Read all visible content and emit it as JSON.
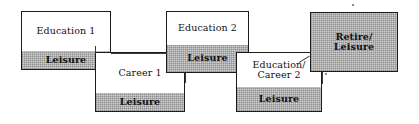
{
  "diagram": {
    "colors": {
      "box_border": "#1b1b1b",
      "segment_gray": "#cfcfcf",
      "segment_white": "#ffffff",
      "connector": "#3a3a3a",
      "text": "#111111",
      "background": "#ffffff"
    },
    "blocks": [
      {
        "id": "education-1",
        "segments": [
          {
            "id": "education-1-title",
            "label": "Education 1",
            "fill": "white",
            "bold": false
          },
          {
            "id": "education-1-leisure",
            "label": "Leisure",
            "fill": "gray",
            "bold": true
          }
        ]
      },
      {
        "id": "career-1",
        "segments": [
          {
            "id": "career-1-title",
            "label": "Career 1",
            "fill": "white",
            "bold": false
          },
          {
            "id": "career-1-leisure",
            "label": "Leisure",
            "fill": "gray",
            "bold": true
          }
        ]
      },
      {
        "id": "education-2",
        "segments": [
          {
            "id": "education-2-title",
            "label": "Education 2",
            "fill": "white",
            "bold": false
          },
          {
            "id": "education-2-leisure",
            "label": "Leisure",
            "fill": "gray",
            "bold": true
          }
        ]
      },
      {
        "id": "education-career-2",
        "segments": [
          {
            "id": "education-career-2-title",
            "label": "Education/\nCareer 2",
            "fill": "white",
            "bold": false
          },
          {
            "id": "education-career-2-leisure",
            "label": "Leisure",
            "fill": "gray",
            "bold": true
          }
        ]
      },
      {
        "id": "retire-leisure",
        "segments": [
          {
            "id": "retire-leisure-title",
            "label": "Retire/\nLeisure",
            "fill": "gray",
            "bold": true
          }
        ]
      }
    ]
  }
}
